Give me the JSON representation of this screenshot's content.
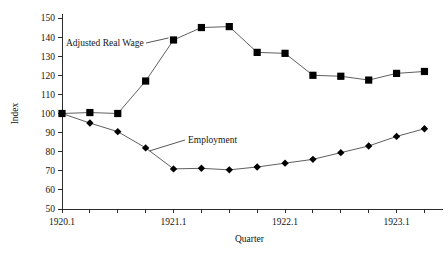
{
  "chart_data": {
    "type": "line",
    "title": "",
    "xlabel": "Quarter",
    "ylabel": "Index",
    "ylim": [
      50,
      150
    ],
    "ytick_step": 10,
    "yticks": [
      50,
      60,
      70,
      80,
      90,
      100,
      110,
      120,
      130,
      140,
      150
    ],
    "x": [
      "1920.1",
      "1920.2",
      "1920.3",
      "1920.4",
      "1921.1",
      "1921.2",
      "1921.3",
      "1921.4",
      "1922.1",
      "1922.2",
      "1922.3",
      "1922.4",
      "1923.1",
      "1923.2"
    ],
    "xticks_labeled": [
      "1920.1",
      "1921.1",
      "1922.1",
      "1923.1"
    ],
    "grid": false,
    "legend_position": "inline-annotation",
    "series": [
      {
        "name": "Adjusted Real Wage",
        "marker": "square",
        "values": [
          100,
          100.5,
          100,
          117,
          138.5,
          145,
          145.5,
          132,
          131.5,
          120,
          119.5,
          117.5,
          121,
          122
        ]
      },
      {
        "name": "Employment",
        "marker": "diamond",
        "values": [
          100,
          95,
          90.5,
          82,
          71,
          71.3,
          70.5,
          72,
          74,
          76,
          79.5,
          83,
          88,
          92
        ]
      }
    ],
    "annotations": [
      {
        "text": "Adjusted Real Wage",
        "points_to": "1921.1"
      },
      {
        "text": "Employment",
        "points_to": "1920.4"
      }
    ]
  },
  "axes": {
    "y_title": "Index",
    "x_title": "Quarter"
  },
  "colors": {
    "marker": "#000000",
    "line": "#4d4d4d",
    "axis": "#2b2b2b",
    "background": "#ffffff",
    "text": "#141414"
  }
}
